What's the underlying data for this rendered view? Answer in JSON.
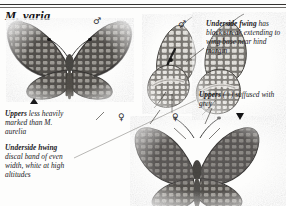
{
  "plate": {
    "title": "M. varia",
    "background_color": "#fdfdfc",
    "ink_color": "#17161a"
  },
  "captions": {
    "uppers_vs_aurelia": {
      "lead": "Uppers",
      "body": " less heavily marked than M. aurelia"
    },
    "underside_hwing": {
      "lead": "Underside hwing",
      "body": " discal band of even width, white at high altitudes"
    },
    "underside_fwing": {
      "lead": "Underside fwing",
      "body": " has black streak extending to wing base near hind margin"
    },
    "uppers_female": {
      "lead": "Uppers",
      "body": " (♀) suffused with grey"
    }
  },
  "symbols": {
    "male_upperside": "♂",
    "male_underside": "♂",
    "female_underside": "♀",
    "female_upperside": "♀",
    "triangle_up": "▲",
    "triangle_down": "▼"
  },
  "specimens": [
    {
      "id": "male-upperside",
      "name": "male-upperside-specimen",
      "sex": "♂",
      "view": "upperside",
      "ground_color": "#8d8a86",
      "marking_color": "#4c4a49"
    },
    {
      "id": "male-underside",
      "name": "male-underside-specimen",
      "sex": "♂",
      "view": "underside",
      "ground_color": "#b4b1ab",
      "marking_color": "#56544f"
    },
    {
      "id": "female-underside",
      "name": "female-underside-specimen",
      "sex": "♀",
      "view": "underside",
      "ground_color": "#b9b6b0",
      "marking_color": "#5a5752"
    },
    {
      "id": "female-upperside",
      "name": "female-upperside-specimen",
      "sex": "♀",
      "view": "upperside",
      "ground_color": "#8a8783",
      "marking_color": "#4a4847"
    }
  ]
}
